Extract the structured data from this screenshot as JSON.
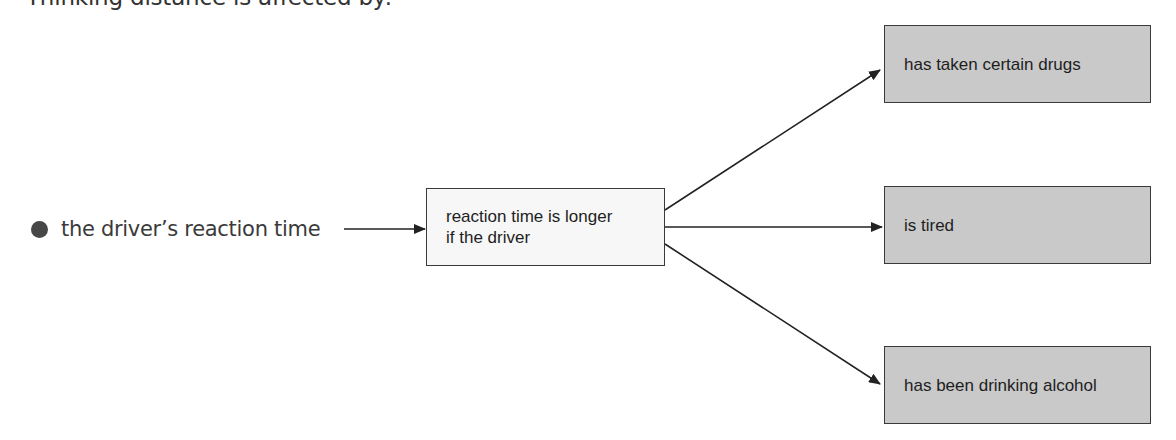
{
  "heading": "Thinking distance is affected by:",
  "bullet": {
    "text": "the driver’s reaction time",
    "icon": "filled-circle-bullet"
  },
  "center_box": {
    "line1": "reaction time is longer",
    "line2": "if the driver"
  },
  "outcomes": [
    {
      "label": "has taken certain drugs"
    },
    {
      "label": "is tired"
    },
    {
      "label": "has been drinking alcohol"
    }
  ],
  "colors": {
    "outcome_fill": "#c9c9c9",
    "center_fill": "#f7f7f7",
    "border": "#3a3a3a",
    "arrow": "#222222",
    "bullet": "#474747"
  }
}
